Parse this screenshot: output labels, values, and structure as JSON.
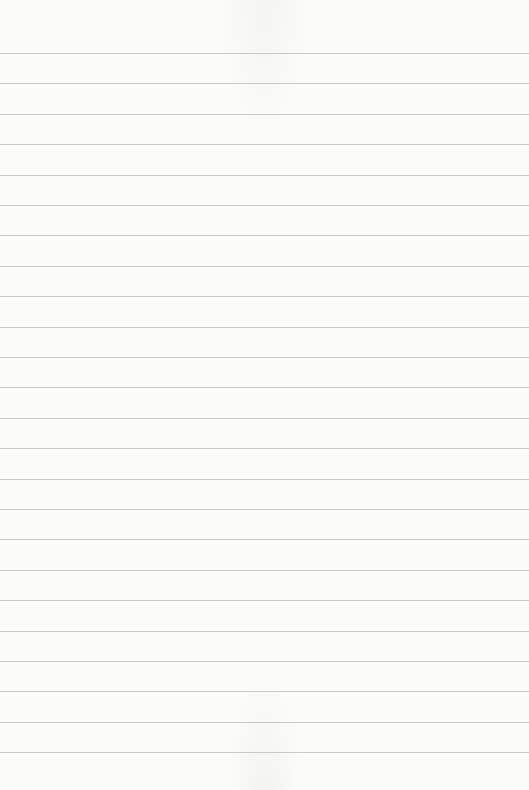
{
  "page": {
    "kind": "lined-paper",
    "line_count": 24,
    "colors": {
      "paper": "#fbfbfa",
      "rule": "#c9c9c9"
    }
  }
}
